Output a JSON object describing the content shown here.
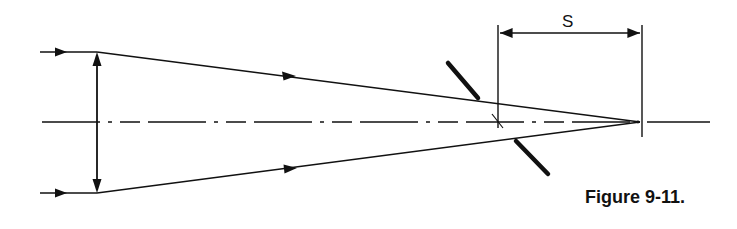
{
  "figure": {
    "caption": "Figure 9-11.",
    "dimension_label": "S",
    "colors": {
      "ink": "#111111",
      "background": "#ffffff"
    },
    "elements": [
      "incoming-ray-top",
      "incoming-ray-bottom",
      "lens-double-arrow",
      "optical-axis-dash-dot",
      "converging-ray-top",
      "converging-ray-bottom",
      "tilted-plate",
      "focal-point",
      "dimension-S"
    ]
  }
}
